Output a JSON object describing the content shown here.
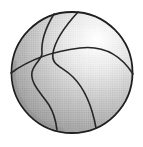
{
  "image": {
    "description": "Grayscale halftone clipart drawing of a basketball with curved seam lines and a bright highlight on the upper right",
    "subject": "basketball"
  },
  "colors": {
    "background": "#ffffff",
    "outline": "#1f1f1f",
    "seam": "#262626",
    "highlight": "#ffffff",
    "tone_light": "#ececec",
    "tone_mid": "#cfcfcf",
    "tone_dark": "#b2b2b2",
    "tone_edge": "#949494",
    "rim_shadow": "#8f8f8f",
    "grain": "#606060"
  }
}
